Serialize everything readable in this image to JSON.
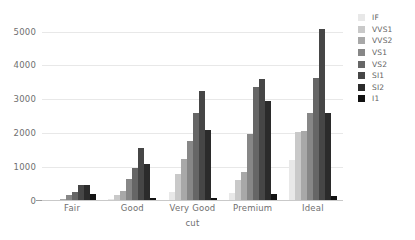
{
  "chart_data": {
    "type": "bar",
    "title": "",
    "subtitle": "",
    "xlabel": "cut",
    "ylabel": "",
    "categories": [
      "Fair",
      "Good",
      "Very Good",
      "Premium",
      "Ideal"
    ],
    "series": [
      {
        "name": "IF",
        "color": "#e8e8e8",
        "values": [
          10,
          70,
          270,
          230,
          1210
        ]
      },
      {
        "name": "VVS1",
        "color": "#c9c9c9",
        "values": [
          20,
          190,
          790,
          620,
          2050
        ]
      },
      {
        "name": "VVS2",
        "color": "#a8a8a8",
        "values": [
          70,
          290,
          1240,
          870,
          2080
        ]
      },
      {
        "name": "VS1",
        "color": "#878787",
        "values": [
          170,
          650,
          1770,
          1990,
          2590
        ]
      },
      {
        "name": "VS2",
        "color": "#666666",
        "values": [
          260,
          980,
          2590,
          3360,
          3620
        ]
      },
      {
        "name": "SI1",
        "color": "#464646",
        "values": [
          460,
          1560,
          3240,
          3600,
          5070
        ]
      },
      {
        "name": "SI2",
        "color": "#2b2b2b",
        "values": [
          470,
          1090,
          2100,
          2950,
          2600
        ]
      },
      {
        "name": "I1",
        "color": "#121212",
        "values": [
          210,
          100,
          85,
          210,
          150
        ]
      }
    ],
    "ylim": [
      0,
      5400
    ],
    "yticks": [
      0,
      1000,
      2000,
      3000,
      4000,
      5000
    ],
    "ytick_labels": [
      "0",
      "1000",
      "2000",
      "3000",
      "4000",
      "5000"
    ],
    "grid": true,
    "grid_axis": "y",
    "legend_position": "right",
    "legend_title": "",
    "background_color": "#ffffff",
    "gridline_color": "#e8e8e8",
    "axis_color": "#c9c9c9",
    "text_color": "#6f6f6f"
  }
}
